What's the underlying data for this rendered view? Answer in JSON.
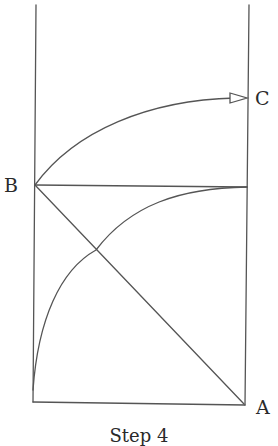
{
  "diagram": {
    "labels": {
      "a": "A",
      "b": "B",
      "c": "C"
    },
    "caption": "Step 4",
    "colors": {
      "stroke": "#555555",
      "text": "#2a2a2a",
      "background": "#ffffff"
    },
    "elements": {
      "left_vertical_line": "line from top to bottom-left corner",
      "right_vertical_line": "line from top to bottom-right corner A",
      "bottom_line": "line connecting bottom-left corner to A",
      "horizontal_line_BC": "horizontal line from B to right vertical line",
      "diagonal_BA": "straight line from B to A",
      "upper_curve": "curved arrow from B to C with open arrowhead",
      "lower_curve": "curve from bottom-left rising to meet right vertical line at height of B"
    }
  }
}
